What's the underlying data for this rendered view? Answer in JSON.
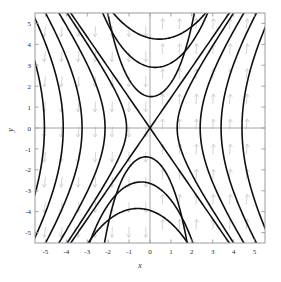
{
  "figure": {
    "kind": "phase-portrait",
    "background_color": "#ffffff",
    "frame_color": "#9a9a9a",
    "axis_line_color": "#9a9a9a",
    "trajectory_color": "#101010",
    "vector_field_color": "#c9c9c9"
  },
  "chart_data": {
    "type": "line",
    "title": "",
    "subtitle": "",
    "xlabel": "x",
    "ylabel": "y",
    "xlim": [
      -5.5,
      5.5
    ],
    "ylim": [
      -5.5,
      5.5
    ],
    "grid": false,
    "legend": null,
    "legend_position": "none",
    "xticks": [
      -5,
      -4,
      -3,
      -2,
      -1,
      0,
      1,
      2,
      3,
      4,
      5
    ],
    "xticklabels": [
      "-5",
      "-4",
      "-3",
      "-2",
      "-1",
      "0",
      "1",
      "2",
      "3",
      "4",
      "5"
    ],
    "yticks": [
      -5,
      -4,
      -3,
      -2,
      -1,
      0,
      1,
      2,
      3,
      4,
      5
    ],
    "yticklabels": [
      "-5",
      "-4",
      "-3",
      "-2",
      "-1",
      "0",
      "1",
      "2",
      "3",
      "4",
      "5"
    ],
    "fixed_points": [
      {
        "x": 0,
        "y": 0,
        "type": "saddle"
      }
    ],
    "separatrices": [
      {
        "name": "unstable-manifold",
        "slope": 1.45,
        "through": [
          0,
          0
        ]
      },
      {
        "name": "stable-manifold",
        "slope": -1.45,
        "through": [
          0,
          0
        ]
      }
    ],
    "series": [
      {
        "name": "upper-branch-1",
        "vertex": [
          0.45,
          4.25
        ],
        "a": 4.25,
        "b": 2.95
      },
      {
        "name": "upper-branch-2",
        "vertex": [
          0.25,
          2.9
        ],
        "a": 2.9,
        "b": 2.0
      },
      {
        "name": "upper-branch-3",
        "vertex": [
          0.05,
          1.5
        ],
        "a": 1.5,
        "b": 1.05
      },
      {
        "name": "lower-branch-1",
        "vertex": [
          -0.2,
          -1.38
        ],
        "a": 1.38,
        "b": 0.96
      },
      {
        "name": "lower-branch-2",
        "vertex": [
          -0.42,
          -2.58
        ],
        "a": 2.58,
        "b": 1.78
      },
      {
        "name": "lower-branch-3",
        "vertex": [
          -0.58,
          -3.85
        ],
        "a": 3.85,
        "b": 2.66
      },
      {
        "name": "left-branch-1",
        "vertex": [
          -1.12,
          0.0
        ],
        "a": 1.12,
        "b": 1.62
      },
      {
        "name": "left-branch-2",
        "vertex": [
          -2.15,
          0.0
        ],
        "a": 2.15,
        "b": 3.12
      },
      {
        "name": "left-branch-3",
        "vertex": [
          -3.25,
          0.0
        ],
        "a": 3.25,
        "b": 4.71
      },
      {
        "name": "left-branch-4",
        "vertex": [
          -4.15,
          0.0
        ],
        "a": 4.15,
        "b": 6.02
      },
      {
        "name": "left-branch-5",
        "vertex": [
          -5.05,
          0.0
        ],
        "a": 5.05,
        "b": 7.32
      },
      {
        "name": "right-branch-1",
        "vertex": [
          1.3,
          0.0
        ],
        "a": 1.3,
        "b": 1.89
      },
      {
        "name": "right-branch-2",
        "vertex": [
          2.4,
          0.0
        ],
        "a": 2.4,
        "b": 3.48
      },
      {
        "name": "right-branch-3",
        "vertex": [
          3.4,
          0.0
        ],
        "a": 3.4,
        "b": 4.93
      },
      {
        "name": "right-branch-4",
        "vertex": [
          4.4,
          0.0
        ],
        "a": 4.4,
        "b": 6.38
      }
    ],
    "vector_field": {
      "description": "arrows point downward for x<0 and upward for x>0",
      "grid_x": [
        -5.0,
        -4.2,
        -3.4,
        -2.6,
        -1.8,
        -1.0,
        -0.2,
        0.6,
        1.4,
        2.2,
        3.0,
        3.8,
        4.6
      ],
      "grid_y": [
        -4.8,
        -3.6,
        -2.4,
        -1.2,
        0.0,
        1.2,
        2.4,
        3.6,
        4.8
      ]
    }
  }
}
